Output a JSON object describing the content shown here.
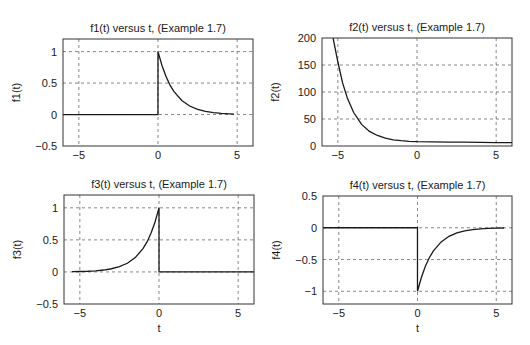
{
  "chart_data": [
    {
      "type": "line",
      "title": "f1(t) versus t, (Example 1.7)",
      "xlabel": "",
      "ylabel": "f1(t)",
      "xlim": [
        -6,
        6
      ],
      "ylim": [
        -0.5,
        1.2
      ],
      "xticks": [
        -5,
        0,
        5
      ],
      "xtick_labels": [
        "−5",
        "0",
        "5"
      ],
      "yticks": [
        -0.5,
        0,
        0.5,
        1
      ],
      "ytick_labels": [
        "−0.5",
        "0",
        "0.5",
        "1"
      ],
      "grid": true,
      "box": {
        "left": 63,
        "top": 39,
        "right": 253,
        "bottom": 146
      },
      "x": [
        -6,
        -0.001,
        0,
        0.25,
        0.5,
        0.75,
        1,
        1.5,
        2,
        2.5,
        3,
        3.5,
        4,
        4.5,
        4.8
      ],
      "y": [
        0,
        0,
        1,
        0.779,
        0.607,
        0.472,
        0.368,
        0.223,
        0.135,
        0.082,
        0.05,
        0.03,
        0.018,
        0.011,
        0.008
      ]
    },
    {
      "type": "line",
      "title": "f2(t) versus t, (Example 1.7)",
      "xlabel": "",
      "ylabel": "f2(t)",
      "xlim": [
        -6,
        6
      ],
      "ylim": [
        0,
        200
      ],
      "xticks": [
        -5,
        0,
        5
      ],
      "xtick_labels": [
        "−5",
        "0",
        "5"
      ],
      "yticks": [
        0,
        50,
        100,
        150,
        200
      ],
      "ytick_labels": [
        "0",
        "50",
        "100",
        "150",
        "200"
      ],
      "grid": true,
      "box": {
        "left": 322,
        "top": 38,
        "right": 512,
        "bottom": 146
      },
      "x": [
        -5.3,
        -5.0,
        -4.7,
        -4.4,
        -4.0,
        -3.5,
        -3.0,
        -2.5,
        -2.0,
        -1.5,
        -1.0,
        -0.5,
        0,
        1,
        2,
        3,
        4,
        5,
        6
      ],
      "y": [
        200,
        156,
        117,
        89,
        62,
        40,
        27,
        19.5,
        14.5,
        11.5,
        9.8,
        8.6,
        8,
        7.6,
        7.3,
        7.0,
        6.7,
        6.4,
        6.1
      ]
    },
    {
      "type": "line",
      "title": "f3(t) versus t, (Example 1.7)",
      "xlabel": "t",
      "ylabel": "f3(t)",
      "xlim": [
        -6,
        6
      ],
      "ylim": [
        -0.5,
        1.2
      ],
      "xticks": [
        -5,
        0,
        5
      ],
      "xtick_labels": [
        "−5",
        "0",
        "5"
      ],
      "yticks": [
        -0.5,
        0,
        0.5,
        1
      ],
      "ytick_labels": [
        "−0.5",
        "0",
        "0.5",
        "1"
      ],
      "grid": true,
      "box": {
        "left": 64,
        "top": 195,
        "right": 254,
        "bottom": 304
      },
      "x": [
        -5.5,
        -5,
        -4.5,
        -4,
        -3.5,
        -3,
        -2.5,
        -2,
        -1.5,
        -1,
        -0.75,
        -0.5,
        -0.25,
        0,
        0.001,
        6
      ],
      "y": [
        0.004,
        0.007,
        0.011,
        0.018,
        0.03,
        0.05,
        0.082,
        0.135,
        0.223,
        0.368,
        0.472,
        0.607,
        0.779,
        1,
        0,
        0
      ]
    },
    {
      "type": "line",
      "title": "f4(t) versus t, (Example 1.7)",
      "xlabel": "t",
      "ylabel": "f4(t)",
      "xlim": [
        -6,
        6
      ],
      "ylim": [
        -1.2,
        0.5
      ],
      "xticks": [
        -5,
        0,
        5
      ],
      "xtick_labels": [
        "−5",
        "0",
        "5"
      ],
      "yticks": [
        -1,
        -0.5,
        0,
        0.5
      ],
      "ytick_labels": [
        "−1",
        "−0.5",
        "0",
        "0.5"
      ],
      "grid": true,
      "box": {
        "left": 323,
        "top": 196,
        "right": 512,
        "bottom": 304
      },
      "x": [
        -6,
        -0.001,
        0,
        0.25,
        0.5,
        0.75,
        1,
        1.5,
        2,
        2.5,
        3,
        3.5,
        4,
        4.5,
        5,
        5.5
      ],
      "y": [
        0,
        0,
        -1,
        -0.779,
        -0.607,
        -0.472,
        -0.368,
        -0.223,
        -0.135,
        -0.082,
        -0.05,
        -0.03,
        -0.018,
        -0.011,
        -0.007,
        -0.004
      ]
    }
  ],
  "colors": {
    "line": "#1a1a1a",
    "grid": "#555555",
    "axes": "#333333",
    "background": "#ffffff"
  }
}
